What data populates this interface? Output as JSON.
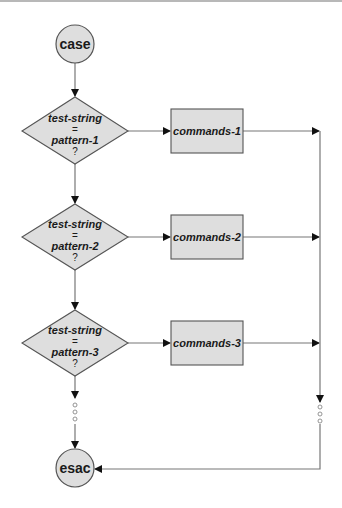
{
  "diagram": {
    "type": "flowchart",
    "colors": {
      "fill": "#dedede",
      "stroke": "#555555",
      "line": "#777777",
      "arrow": "#111111",
      "text": "#1a1a1a"
    },
    "start": {
      "label": "case"
    },
    "end": {
      "label": "esac"
    },
    "decisions": [
      {
        "line1": "test-string",
        "line2": "=",
        "line3": "pattern-1",
        "line4": "?"
      },
      {
        "line1": "test-string",
        "line2": "=",
        "line3": "pattern-2",
        "line4": "?"
      },
      {
        "line1": "test-string",
        "line2": "=",
        "line3": "pattern-3",
        "line4": "?"
      }
    ],
    "actions": [
      {
        "label": "commands-1"
      },
      {
        "label": "commands-2"
      },
      {
        "label": "commands-3"
      }
    ],
    "continuation": "ellipsis-vertical"
  }
}
